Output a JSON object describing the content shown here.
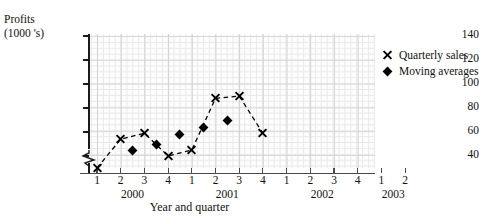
{
  "chart_data": {
    "type": "scatter",
    "title": "",
    "ylabel_line1": "Profits",
    "ylabel_line2": "(1000 's)",
    "xlabel": "Year and quarter",
    "ylim": [
      30,
      140
    ],
    "yticks": [
      40,
      60,
      80,
      100,
      120,
      140
    ],
    "y_axis_broken": true,
    "grid": true,
    "legend_position": "right",
    "x_categories": [
      {
        "quarter": "1",
        "year": "2000"
      },
      {
        "quarter": "2",
        "year": "2000"
      },
      {
        "quarter": "3",
        "year": "2000"
      },
      {
        "quarter": "4",
        "year": "2000"
      },
      {
        "quarter": "1",
        "year": "2001"
      },
      {
        "quarter": "2",
        "year": "2001"
      },
      {
        "quarter": "3",
        "year": "2001"
      },
      {
        "quarter": "4",
        "year": "2001"
      },
      {
        "quarter": "1",
        "year": "2002"
      },
      {
        "quarter": "2",
        "year": "2002"
      },
      {
        "quarter": "3",
        "year": "2002"
      },
      {
        "quarter": "4",
        "year": "2002"
      },
      {
        "quarter": "1",
        "year": "2003"
      },
      {
        "quarter": "2",
        "year": "2003"
      }
    ],
    "series": [
      {
        "name": "Quarterly sales",
        "marker": "cross",
        "connected": true,
        "points": [
          {
            "x": 1.0,
            "y": 30
          },
          {
            "x": 2.0,
            "y": 54
          },
          {
            "x": 3.0,
            "y": 59
          },
          {
            "x": 4.0,
            "y": 40
          },
          {
            "x": 5.0,
            "y": 45
          },
          {
            "x": 6.0,
            "y": 88
          },
          {
            "x": 7.0,
            "y": 90
          },
          {
            "x": 8.0,
            "y": 59
          }
        ]
      },
      {
        "name": "Moving averages",
        "marker": "diamond",
        "connected": false,
        "points": [
          {
            "x": 2.5,
            "y": 45
          },
          {
            "x": 3.5,
            "y": 50
          },
          {
            "x": 4.5,
            "y": 58
          },
          {
            "x": 5.5,
            "y": 64
          },
          {
            "x": 6.5,
            "y": 70
          }
        ]
      }
    ]
  },
  "legend": {
    "entries": [
      {
        "label": "Quarterly sales"
      },
      {
        "label": "Moving averages"
      }
    ]
  }
}
